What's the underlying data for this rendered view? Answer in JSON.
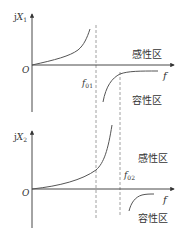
{
  "top_plot": {
    "y_axis_label_prefix": "j",
    "y_axis_label_var": "X",
    "y_axis_label_sub": "1",
    "origin_label": "O",
    "x_axis_label": "f",
    "resonance_label_var": "f",
    "resonance_label_sub": "01",
    "inductive_region_label": "感性区",
    "capacitive_region_label": "容性区"
  },
  "bottom_plot": {
    "y_axis_label_prefix": "j",
    "y_axis_label_var": "X",
    "y_axis_label_sub": "2",
    "origin_label": "O",
    "x_axis_label": "f",
    "resonance_label_var": "f",
    "resonance_label_sub": "02",
    "inductive_region_label": "感性区",
    "capacitive_region_label": "容性区"
  },
  "colors": {
    "axis": "#333333",
    "curve": "#555555",
    "dashed": "#888888"
  }
}
